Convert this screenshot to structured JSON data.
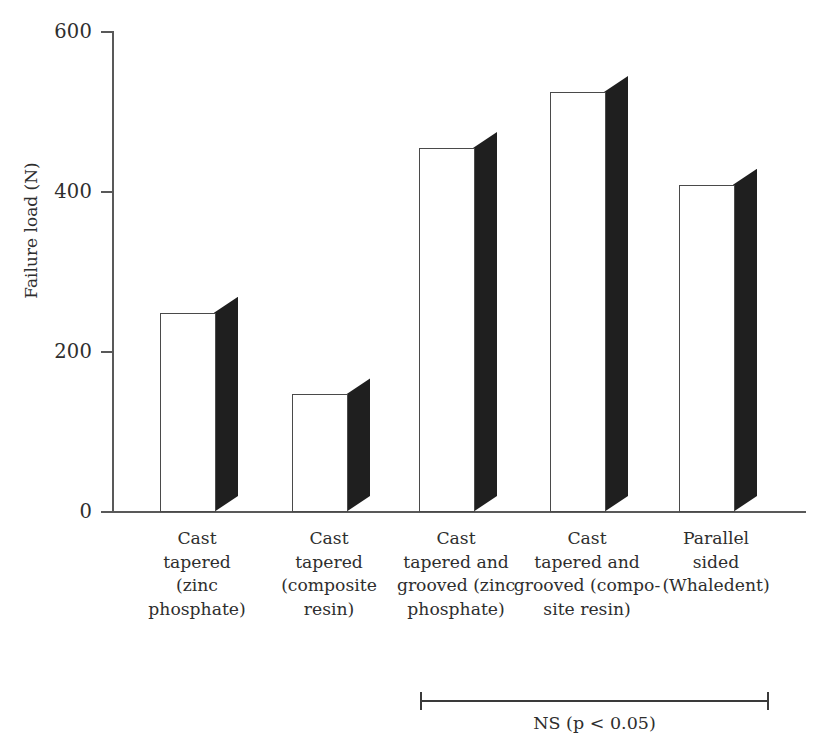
{
  "chart_data": {
    "type": "bar",
    "title": "",
    "xlabel": "",
    "ylabel": "Failure load (N)",
    "ylim": [
      0,
      600
    ],
    "yticks": [
      0,
      200,
      400,
      600
    ],
    "ytick_labels": [
      "0",
      "200",
      "400",
      "600"
    ],
    "grid": false,
    "legend": null,
    "bar_style": "3d-white-face-dark-right-panel",
    "categories": [
      "Cast tapered (zinc phosphate)",
      "Cast tapered (composite resin)",
      "Cast tapered and grooved (zinc phosphate)",
      "Cast tapered and grooved (composite resin)",
      "Parallel sided (Whaledent)"
    ],
    "category_label_lines": [
      [
        "Cast",
        "tapered",
        "(zinc",
        "phosphate)"
      ],
      [
        "Cast",
        "tapered",
        "(composite",
        "resin)"
      ],
      [
        "Cast",
        "tapered and",
        "grooved (zinc",
        "phosphate)"
      ],
      [
        "Cast",
        "tapered and",
        "grooved (compo-",
        "site resin)"
      ],
      [
        "Parallel",
        "sided",
        "(Whaledent)"
      ]
    ],
    "values": [
      249,
      147,
      455,
      525,
      409
    ],
    "annotations": [
      {
        "type": "significance-bracket",
        "label": "NS (p < 0.05)",
        "spans_categories": [
          2,
          3,
          4
        ]
      }
    ]
  },
  "colors": {
    "bar_face": "#ffffff",
    "bar_face_stroke": "#4a4a4a",
    "bar_side": "#1f1f1f",
    "axis": "#595959",
    "text": "#2e2e2e",
    "background": "#ffffff"
  }
}
